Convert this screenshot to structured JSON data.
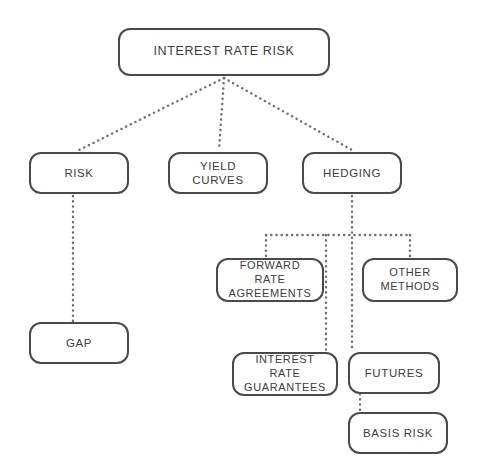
{
  "diagram": {
    "type": "tree-diagram",
    "background_color": "#ffffff",
    "node_border_color": "#4a4a4a",
    "node_fill_color": "#ffffff",
    "node_text_color": "#3c3c3c",
    "connector_color": "#6e6e6e",
    "connector_style": "dotted",
    "nodes": [
      {
        "id": "interest-rate-risk",
        "label": "INTEREST RATE RISK",
        "x": 118,
        "y": 28,
        "width": 212,
        "height": 48,
        "font_size": 12.5,
        "level": 0
      },
      {
        "id": "risk",
        "label": "RISK",
        "x": 29,
        "y": 152,
        "width": 100,
        "height": 42,
        "font_size": 11.5,
        "level": 1
      },
      {
        "id": "yield-curves",
        "label": "YIELD CURVES",
        "x": 168,
        "y": 152,
        "width": 100,
        "height": 42,
        "font_size": 11.5,
        "level": 1
      },
      {
        "id": "hedging",
        "label": "HEDGING",
        "x": 302,
        "y": 152,
        "width": 100,
        "height": 42,
        "font_size": 11.5,
        "level": 1
      },
      {
        "id": "forward-rate-agreements",
        "label": "FORWARD RATE\nAGREEMENTS",
        "x": 216,
        "y": 258,
        "width": 108,
        "height": 44,
        "font_size": 11,
        "level": 2
      },
      {
        "id": "other-methods",
        "label": "OTHER\nMETHODS",
        "x": 362,
        "y": 258,
        "width": 96,
        "height": 44,
        "font_size": 11,
        "level": 2
      },
      {
        "id": "gap",
        "label": "GAP",
        "x": 29,
        "y": 322,
        "width": 100,
        "height": 42,
        "font_size": 11.5,
        "level": 2
      },
      {
        "id": "interest-rate-guarantees",
        "label": "INTEREST RATE\nGUARANTEES",
        "x": 232,
        "y": 352,
        "width": 106,
        "height": 44,
        "font_size": 11,
        "level": 3
      },
      {
        "id": "futures",
        "label": "FUTURES",
        "x": 348,
        "y": 352,
        "width": 92,
        "height": 42,
        "font_size": 11.5,
        "level": 3
      },
      {
        "id": "basis-risk",
        "label": "BASIS RISK",
        "x": 348,
        "y": 412,
        "width": 100,
        "height": 42,
        "font_size": 11.5,
        "level": 4
      }
    ],
    "edges": [
      {
        "id": "edge-irr-risk",
        "from": "interest-rate-risk",
        "to": "risk",
        "shape": "diagonal"
      },
      {
        "id": "edge-irr-yield-curves",
        "from": "interest-rate-risk",
        "to": "yield-curves",
        "shape": "straight"
      },
      {
        "id": "edge-irr-hedging",
        "from": "interest-rate-risk",
        "to": "hedging",
        "shape": "diagonal"
      },
      {
        "id": "edge-risk-gap",
        "from": "risk",
        "to": "gap",
        "shape": "straight"
      },
      {
        "id": "edge-hedging-bus",
        "from": "hedging",
        "to": "bus",
        "shape": "orthogonal"
      },
      {
        "id": "edge-bus-forward-rate-agreements",
        "from": "bus",
        "to": "forward-rate-agreements",
        "shape": "orthogonal"
      },
      {
        "id": "edge-bus-other-methods",
        "from": "bus",
        "to": "other-methods",
        "shape": "orthogonal"
      },
      {
        "id": "edge-bus-interest-rate-guarantees",
        "from": "bus",
        "to": "interest-rate-guarantees",
        "shape": "orthogonal"
      },
      {
        "id": "edge-hedging-futures",
        "from": "hedging",
        "to": "futures",
        "shape": "straight"
      },
      {
        "id": "edge-futures-basis-risk",
        "from": "futures",
        "to": "basis-risk",
        "shape": "straight"
      }
    ]
  }
}
